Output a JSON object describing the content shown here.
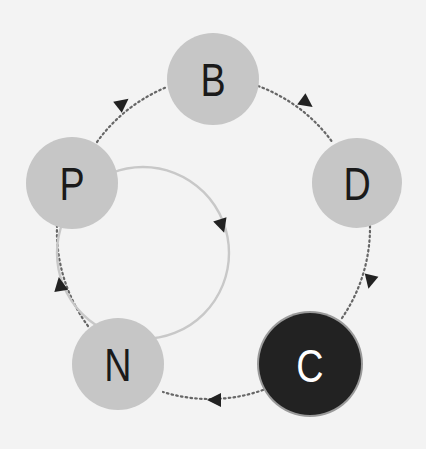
{
  "diagram": {
    "type": "cycle",
    "background": "#f3f3f3",
    "colors": {
      "node_fill": "#c6c6c6",
      "node_text": "#1a1a1a",
      "highlight_fill": "#222222",
      "highlight_ring": "#9a9a9a",
      "highlight_text": "#ffffff",
      "dotted_edge": "#666666",
      "inner_loop": "#c8c8c8",
      "arrow": "#222222"
    },
    "nodes": [
      {
        "id": "B",
        "label": "B",
        "highlighted": false
      },
      {
        "id": "D",
        "label": "D",
        "highlighted": false
      },
      {
        "id": "C",
        "label": "C",
        "highlighted": true
      },
      {
        "id": "N",
        "label": "N",
        "highlighted": false
      },
      {
        "id": "P",
        "label": "P",
        "highlighted": false
      }
    ],
    "edges": [
      {
        "from": "P",
        "to": "B",
        "style": "dotted"
      },
      {
        "from": "B",
        "to": "D",
        "style": "dotted"
      },
      {
        "from": "D",
        "to": "C",
        "style": "dotted"
      },
      {
        "from": "C",
        "to": "N",
        "style": "dotted"
      },
      {
        "from": "N",
        "to": "P",
        "style": "dotted"
      },
      {
        "from": "P",
        "to": "N",
        "style": "solid",
        "note": "inner loop, clockwise"
      }
    ]
  }
}
